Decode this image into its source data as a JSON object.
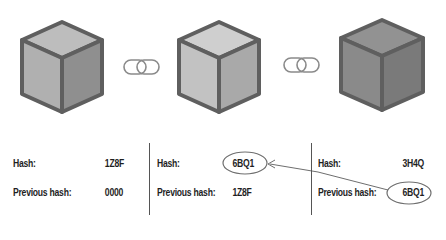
{
  "diagram": {
    "type": "blockchain",
    "blocks": [
      {
        "id": "block-1",
        "hash_label": "Hash:",
        "hash": "1Z8F",
        "prev_label": "Previous hash:",
        "prev_hash": "0000",
        "cube_color": "#b3b3b3"
      },
      {
        "id": "block-2",
        "hash_label": "Hash:",
        "hash": "6BQ1",
        "prev_label": "Previous hash:",
        "prev_hash": "1Z8F",
        "cube_color": "#c4c4c4"
      },
      {
        "id": "block-3",
        "hash_label": "Hash:",
        "hash": "3H4Q",
        "prev_label": "Previous hash:",
        "prev_hash": "6BQ1",
        "cube_color": "#8e8e8e"
      }
    ],
    "links": [
      {
        "icon": "chain-link-icon"
      },
      {
        "icon": "chain-link-icon"
      }
    ],
    "annotation": {
      "from": "block-3.prev_hash",
      "to": "block-2.hash",
      "style": "circled-with-arrow"
    },
    "colors": {
      "outline": "#5f5f5f",
      "text": "#1e1e1e",
      "annotation": "#6e6e6e"
    }
  }
}
